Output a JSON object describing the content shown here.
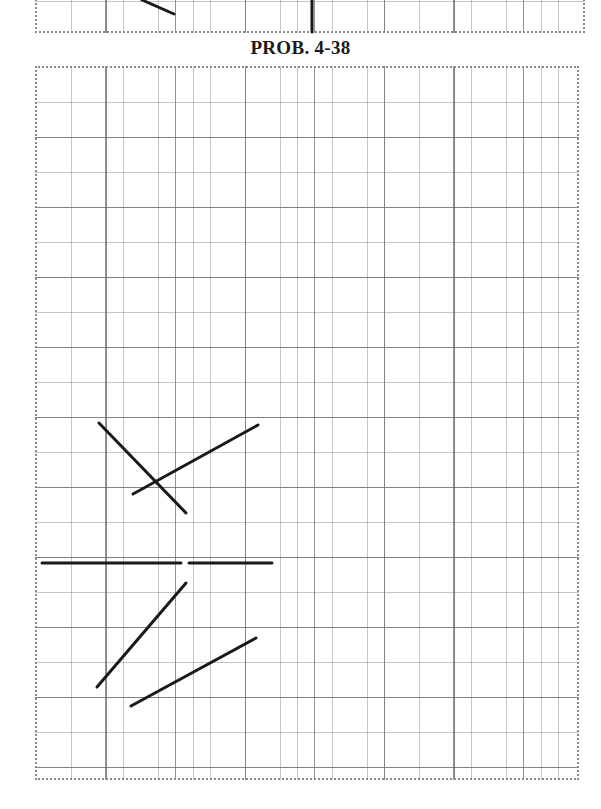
{
  "title": "PROB. 4-38",
  "colors": {
    "line": "#1a1a1a",
    "grid_minor": "#9a9a9a",
    "grid_major": "#6e6e6e",
    "background": "#ffffff"
  },
  "grid": {
    "minor_cell_px": 17.4,
    "minor_per_major": 4
  },
  "top_strip_lines": [
    {
      "name": "previous-problem-diagonal",
      "x1": 142,
      "y1": 0,
      "x2": 174,
      "y2": 14
    },
    {
      "name": "previous-problem-vertical",
      "x1": 312,
      "y1": 0,
      "x2": 312,
      "y2": 32
    }
  ],
  "main_lines": [
    {
      "name": "line-a",
      "x1": 99,
      "y1": 423,
      "x2": 186,
      "y2": 513
    },
    {
      "name": "line-b",
      "x1": 133,
      "y1": 494,
      "x2": 258,
      "y2": 425
    },
    {
      "name": "horizontal-left",
      "x1": 42,
      "y1": 563,
      "x2": 181,
      "y2": 563
    },
    {
      "name": "horizontal-right",
      "x1": 189,
      "y1": 563,
      "x2": 272,
      "y2": 563
    },
    {
      "name": "line-c",
      "x1": 97,
      "y1": 687,
      "x2": 186,
      "y2": 583
    },
    {
      "name": "line-d",
      "x1": 131,
      "y1": 706,
      "x2": 256,
      "y2": 638
    }
  ]
}
